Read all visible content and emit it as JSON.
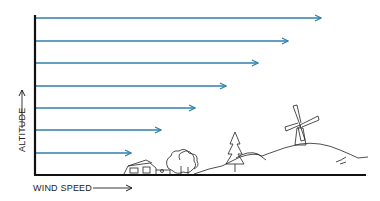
{
  "diagram": {
    "type": "wind-profile",
    "y_axis_label": "ALTITUDE",
    "x_axis_label": "WIND SPEED",
    "arrow_color": "#2f7fad",
    "axis_color": "#111111",
    "arrows": [
      {
        "y": 18,
        "end_x": 321
      },
      {
        "y": 41,
        "end_x": 288
      },
      {
        "y": 63,
        "end_x": 258
      },
      {
        "y": 86,
        "end_x": 226
      },
      {
        "y": 108,
        "end_x": 195
      },
      {
        "y": 130,
        "end_x": 161
      },
      {
        "y": 153,
        "end_x": 131
      }
    ],
    "scene_elements": [
      "houses",
      "trees",
      "evergreen-tree",
      "hill",
      "windmill"
    ]
  }
}
